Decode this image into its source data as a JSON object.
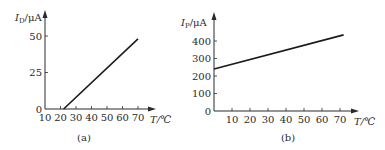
{
  "chart_data": [
    {
      "type": "line",
      "panel": "(a)",
      "caption": "(a)",
      "ylabel_main": "I",
      "ylabel_sub": "D",
      "ylabel_unit": "/μA",
      "xlabel": "T/℃",
      "x_ticks": [
        10,
        20,
        30,
        40,
        50,
        60,
        70
      ],
      "y_ticks": [
        0,
        25,
        50
      ],
      "xlim": [
        10,
        75
      ],
      "ylim": [
        0,
        55
      ],
      "grid": false,
      "series": [
        {
          "name": "I_D",
          "x": [
            22,
            70
          ],
          "y": [
            0,
            48
          ]
        }
      ]
    },
    {
      "type": "line",
      "panel": "(b)",
      "caption": "(b)",
      "ylabel_main": "I",
      "ylabel_sub": "P",
      "ylabel_unit": "/μA",
      "xlabel": "T/℃",
      "x_ticks": [
        10,
        20,
        30,
        40,
        50,
        60,
        70
      ],
      "y_ticks": [
        0,
        100,
        200,
        300,
        400
      ],
      "xlim": [
        0,
        78
      ],
      "ylim": [
        0,
        450
      ],
      "grid": false,
      "series": [
        {
          "name": "I_P",
          "x": [
            0,
            72
          ],
          "y": [
            240,
            435
          ]
        }
      ]
    }
  ]
}
